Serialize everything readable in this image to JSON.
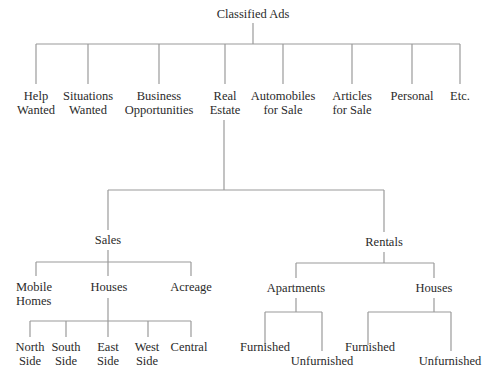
{
  "diagram": {
    "type": "tree",
    "line_color": "#9a9a9a",
    "root": "Classified Ads",
    "categories": [
      {
        "line1": "Help",
        "line2": "Wanted"
      },
      {
        "line1": "Situations",
        "line2": "Wanted"
      },
      {
        "line1": "Business",
        "line2": "Opportunities"
      },
      {
        "line1": "Real",
        "line2": "Estate"
      },
      {
        "line1": "Automobiles",
        "line2": "for Sale"
      },
      {
        "line1": "Articles",
        "line2": "for Sale"
      },
      {
        "line1": "Personal",
        "line2": ""
      },
      {
        "line1": "Etc.",
        "line2": ""
      }
    ],
    "real_estate": {
      "sales": {
        "label": "Sales",
        "children": [
          {
            "line1": "Mobile",
            "line2": "Homes"
          },
          {
            "line1": "Houses",
            "line2": ""
          },
          {
            "line1": "Acreage",
            "line2": ""
          }
        ],
        "houses_children": [
          {
            "line1": "North",
            "line2": "Side"
          },
          {
            "line1": "South",
            "line2": "Side"
          },
          {
            "line1": "East",
            "line2": "Side"
          },
          {
            "line1": "West",
            "line2": "Side"
          },
          {
            "line1": "Central",
            "line2": ""
          }
        ]
      },
      "rentals": {
        "label": "Rentals",
        "apartments": {
          "label": "Apartments",
          "children": [
            "Furnished",
            "Unfurnished"
          ]
        },
        "houses": {
          "label": "Houses",
          "children": [
            "Furnished",
            "Unfurnished"
          ]
        }
      }
    }
  }
}
